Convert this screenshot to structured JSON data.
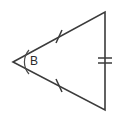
{
  "figure": {
    "kind": "geometry-diagram",
    "shape": "triangle",
    "background_color": "#ffffff",
    "stroke_color": "#3b3b3b",
    "label_color": "#2b2b2b",
    "width": 119,
    "height": 114,
    "vertices": [
      {
        "name": "left-vertex",
        "x": 13,
        "y": 62,
        "label": "B",
        "label_x": 34,
        "label_y": 62
      },
      {
        "name": "top-right-vertex",
        "x": 105,
        "y": 12,
        "label": "",
        "label_x": 0,
        "label_y": 0
      },
      {
        "name": "bottom-right-vertex",
        "x": 105,
        "y": 110,
        "label": "",
        "label_x": 0,
        "label_y": 0
      }
    ],
    "outline_path": "M 13 62 L 105 12 L 105 110 Z",
    "sides": [
      {
        "name": "upper-slant-side",
        "from": "left-vertex",
        "to": "top-right-vertex",
        "congruence_ticks": 1,
        "tick_marks": [
          {
            "x1": 56,
            "y1": 43,
            "x2": 62,
            "y2": 30
          }
        ]
      },
      {
        "name": "lower-slant-side",
        "from": "left-vertex",
        "to": "bottom-right-vertex",
        "congruence_ticks": 1,
        "tick_marks": [
          {
            "x1": 56,
            "y1": 79,
            "x2": 62,
            "y2": 92
          }
        ]
      },
      {
        "name": "right-vertical-side",
        "from": "top-right-vertex",
        "to": "bottom-right-vertex",
        "congruence_ticks": 2,
        "tick_marks": [
          {
            "x1": 98,
            "y1": 58,
            "x2": 112,
            "y2": 58
          },
          {
            "x1": 98,
            "y1": 63,
            "x2": 112,
            "y2": 63
          }
        ]
      }
    ],
    "angle_marks": [
      {
        "name": "angle-arc-b",
        "at_vertex": "left-vertex",
        "label": "B",
        "arc_path": "M 29 50 A 18 18 0 0 0 29 74"
      }
    ]
  }
}
